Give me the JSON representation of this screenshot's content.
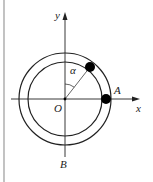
{
  "diagram": {
    "labels": {
      "y_axis": "y",
      "x_axis": "x",
      "origin": "O",
      "point_A": "A",
      "point_B": "B",
      "angle": "α"
    },
    "colors": {
      "stroke": "#222222",
      "border": "#999999",
      "ball": "#000000"
    }
  }
}
